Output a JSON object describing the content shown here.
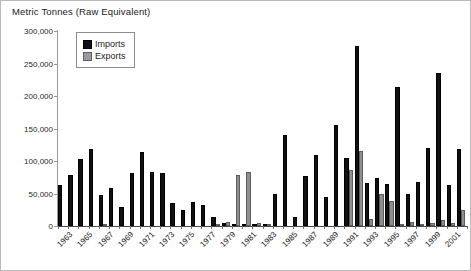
{
  "chart_data": {
    "type": "bar",
    "title": "Metric Tonnes (Raw Equivalent)",
    "xlabel": "",
    "ylabel": "",
    "ylim": [
      0,
      300000
    ],
    "ytick_values": [
      0,
      50000,
      100000,
      150000,
      200000,
      250000,
      300000
    ],
    "ytick_labels": [
      "0",
      "50,000",
      "100,000",
      "150,000",
      "200,000",
      "250,000",
      "300,000"
    ],
    "grid": false,
    "legend_position": "top-left-inside",
    "categories": [
      1963,
      1964,
      1965,
      1966,
      1967,
      1968,
      1969,
      1970,
      1971,
      1972,
      1973,
      1974,
      1975,
      1976,
      1977,
      1978,
      1979,
      1980,
      1981,
      1982,
      1983,
      1984,
      1985,
      1986,
      1987,
      1988,
      1989,
      1990,
      1991,
      1992,
      1993,
      1994,
      1995,
      1996,
      1997,
      1998,
      1999,
      2000,
      2001,
      2002
    ],
    "xtick_labels": [
      "1963",
      "1965",
      "1967",
      "1969",
      "1971",
      "1973",
      "1975",
      "1977",
      "1979",
      "1981",
      "1983",
      "1985",
      "1987",
      "1989",
      "1991",
      "1993",
      "1995",
      "1997",
      "1999",
      "2001"
    ],
    "series": [
      {
        "name": "Imports",
        "color": "#111111",
        "values": [
          63000,
          78000,
          103000,
          118000,
          48000,
          59000,
          30000,
          81000,
          114000,
          83000,
          81000,
          36000,
          24000,
          37000,
          33000,
          14000,
          5000,
          2000,
          1000,
          1000,
          2000,
          49000,
          140000,
          14000,
          77000,
          110000,
          44000,
          155000,
          104000,
          277000,
          66000,
          74000,
          64000,
          214000,
          49000,
          68000,
          120000,
          236000,
          63000,
          119000
        ]
      },
      {
        "name": "Exports",
        "color": "#8f8f8f",
        "values": [
          0,
          0,
          0,
          0,
          1000,
          0,
          0,
          0,
          0,
          0,
          0,
          0,
          0,
          0,
          0,
          3000,
          6000,
          78000,
          83000,
          5000,
          1000,
          0,
          0,
          0,
          0,
          0,
          0,
          0,
          86000,
          116000,
          11000,
          49000,
          38000,
          2000,
          6000,
          2000,
          5000,
          9000,
          4000,
          25000
        ]
      }
    ]
  }
}
